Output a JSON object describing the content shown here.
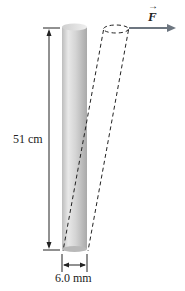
{
  "figure": {
    "length_label": "51 cm",
    "diameter_label": "6.0 mm",
    "force_label": "F",
    "force_vector_arrow": "→",
    "colors": {
      "force_arrow": "#6d7680",
      "rod_light": "#e6e6e6",
      "rod_dark": "#b4b4b4",
      "dimension_lines": "#222222",
      "dashed_outline": "#222222"
    }
  }
}
